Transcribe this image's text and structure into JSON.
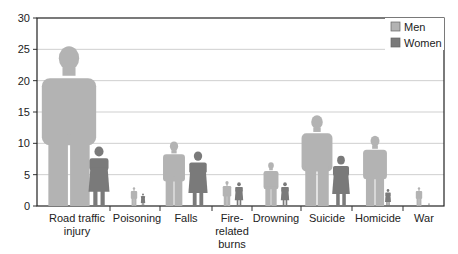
{
  "chart_data": {
    "type": "bar",
    "title": "",
    "xlabel": "",
    "ylabel": "",
    "ylim": [
      0,
      30
    ],
    "yticks": [
      0,
      5,
      10,
      15,
      20,
      25,
      30
    ],
    "grid": true,
    "legend_position": "top-right",
    "categories": [
      "Road traffic injury",
      "Poisoning",
      "Falls",
      "Fire-related burns",
      "Drowning",
      "Suicide",
      "Homicide",
      "War"
    ],
    "category_lines": [
      [
        "Road traffic",
        "injury"
      ],
      [
        "Poisoning"
      ],
      [
        "Falls"
      ],
      [
        "Fire-",
        "related",
        "burns"
      ],
      [
        "Drowning"
      ],
      [
        "Suicide"
      ],
      [
        "Homicide"
      ],
      [
        "War"
      ]
    ],
    "series": [
      {
        "name": "Men",
        "color": "#b3b3b3",
        "values": [
          25.5,
          3.0,
          10.3,
          4.0,
          7.0,
          14.5,
          11.2,
          3.0
        ]
      },
      {
        "name": "Women",
        "color": "#7a7a7a",
        "values": [
          9.5,
          2.0,
          8.7,
          3.8,
          3.8,
          8.0,
          2.7,
          0.5
        ]
      }
    ],
    "marker": "human-figure"
  },
  "legend": {
    "items": [
      {
        "label": "Men",
        "color": "#b3b3b3"
      },
      {
        "label": "Women",
        "color": "#7a7a7a"
      }
    ]
  }
}
